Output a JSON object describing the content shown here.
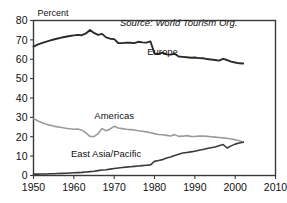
{
  "chart_data": {
    "type": "line",
    "title": "",
    "xlabel": "",
    "ylabel": "Percent",
    "xlim": [
      1950,
      2010
    ],
    "ylim": [
      0,
      80
    ],
    "xticks": [
      1950,
      1960,
      1970,
      1980,
      1990,
      2000,
      2010
    ],
    "yticks": [
      0,
      10,
      20,
      30,
      40,
      50,
      60,
      70,
      80
    ],
    "grid": false,
    "legend_position": "inline-annotations",
    "annotations": [
      {
        "name": "source-note",
        "text": "Source: World Tourism Org.",
        "x": 1986,
        "y": 77,
        "style": "italic"
      }
    ],
    "series": [
      {
        "name": "Europe",
        "color": "#2b2b2b",
        "width": 1.9,
        "label_x": 1982,
        "label_y": 62,
        "x": [
          1950,
          1951,
          1952,
          1953,
          1954,
          1955,
          1956,
          1957,
          1958,
          1959,
          1960,
          1961,
          1962,
          1963,
          1964,
          1965,
          1966,
          1967,
          1968,
          1969,
          1970,
          1971,
          1972,
          1973,
          1974,
          1975,
          1976,
          1977,
          1978,
          1979,
          1980,
          1981,
          1982,
          1983,
          1984,
          1985,
          1986,
          1987,
          1988,
          1989,
          1990,
          1991,
          1992,
          1993,
          1994,
          1995,
          1996,
          1997,
          1998,
          1999,
          2000,
          2001,
          2002
        ],
        "values": [
          66.5,
          67.5,
          68.3,
          69.0,
          69.6,
          70.2,
          70.7,
          71.2,
          71.6,
          72.0,
          72.3,
          72.6,
          72.4,
          73.3,
          75.1,
          73.6,
          72.6,
          73.1,
          71.3,
          70.6,
          70.4,
          68.4,
          68.3,
          68.6,
          68.5,
          68.3,
          69.0,
          68.7,
          68.6,
          69.2,
          63.0,
          62.7,
          63.4,
          62.5,
          62.4,
          62.8,
          61.4,
          61.2,
          61.0,
          60.8,
          60.9,
          60.6,
          60.5,
          60.1,
          59.9,
          59.6,
          59.3,
          60.2,
          59.6,
          58.8,
          58.3,
          57.9,
          57.8
        ]
      },
      {
        "name": "Americas",
        "color": "#9b9b9b",
        "width": 1.6,
        "label_x": 1970,
        "label_y": 29,
        "x": [
          1950,
          1951,
          1952,
          1953,
          1954,
          1955,
          1956,
          1957,
          1958,
          1959,
          1960,
          1961,
          1962,
          1963,
          1964,
          1965,
          1966,
          1967,
          1968,
          1969,
          1970,
          1971,
          1972,
          1973,
          1974,
          1975,
          1976,
          1977,
          1978,
          1979,
          1980,
          1981,
          1982,
          1983,
          1984,
          1985,
          1986,
          1987,
          1988,
          1989,
          1990,
          1991,
          1992,
          1993,
          1994,
          1995,
          1996,
          1997,
          1998,
          1999,
          2000,
          2001,
          2002
        ],
        "values": [
          29.4,
          28.3,
          27.4,
          26.6,
          26.0,
          25.5,
          25.1,
          24.8,
          24.4,
          24.1,
          23.9,
          24.0,
          23.4,
          22.0,
          20.2,
          20.1,
          21.6,
          24.2,
          23.1,
          24.0,
          25.4,
          24.5,
          24.2,
          23.9,
          23.7,
          23.5,
          23.1,
          22.8,
          22.5,
          22.1,
          21.6,
          21.2,
          21.0,
          20.7,
          20.4,
          21.1,
          20.2,
          20.3,
          20.6,
          20.2,
          20.1,
          20.3,
          20.4,
          20.2,
          20.0,
          19.8,
          19.6,
          19.4,
          19.2,
          18.8,
          18.5,
          17.9,
          17.3
        ]
      },
      {
        "name": "East Asia/Pacific",
        "color": "#3a3a3a",
        "width": 1.6,
        "label_x": 1968,
        "label_y": 9.5,
        "x": [
          1950,
          1951,
          1952,
          1953,
          1954,
          1955,
          1956,
          1957,
          1958,
          1959,
          1960,
          1961,
          1962,
          1963,
          1964,
          1965,
          1966,
          1967,
          1968,
          1969,
          1970,
          1971,
          1972,
          1973,
          1974,
          1975,
          1976,
          1977,
          1978,
          1979,
          1980,
          1981,
          1982,
          1983,
          1984,
          1985,
          1986,
          1987,
          1988,
          1989,
          1990,
          1991,
          1992,
          1993,
          1994,
          1995,
          1996,
          1997,
          1998,
          1999,
          2000,
          2001,
          2002
        ],
        "values": [
          0.7,
          0.7,
          0.8,
          0.8,
          0.9,
          0.9,
          1.0,
          1.1,
          1.2,
          1.3,
          1.4,
          1.5,
          1.6,
          1.8,
          2.0,
          2.2,
          2.5,
          2.8,
          3.0,
          3.3,
          3.6,
          3.9,
          4.1,
          4.3,
          4.5,
          4.7,
          4.9,
          5.1,
          5.3,
          5.5,
          7.3,
          7.7,
          8.2,
          9.0,
          9.5,
          10.3,
          11.0,
          11.6,
          11.9,
          12.2,
          12.5,
          13.0,
          13.4,
          13.9,
          14.3,
          14.7,
          15.4,
          16.0,
          14.2,
          15.3,
          16.2,
          16.8,
          17.2
        ]
      }
    ]
  }
}
